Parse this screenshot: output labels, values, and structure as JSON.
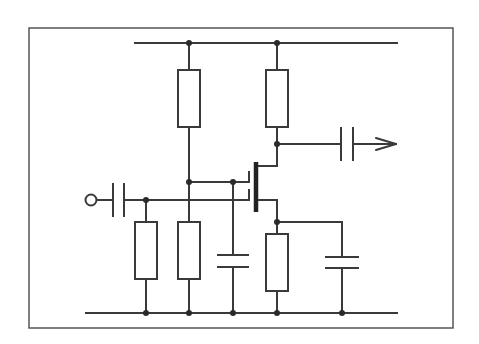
{
  "diagram": {
    "title": "Dual-gate MOSFET amplifier stage",
    "type": "circuit-schematic",
    "colors": {
      "line": "#3a3a3a",
      "frame": "#555555",
      "background": "#ffffff"
    },
    "components": [
      {
        "id": "R1",
        "kind": "resistor",
        "position": "top-left, supply to gate2 bias"
      },
      {
        "id": "R2",
        "kind": "resistor",
        "position": "top-right, drain load"
      },
      {
        "id": "R3",
        "kind": "resistor",
        "position": "gate1 to ground"
      },
      {
        "id": "R4",
        "kind": "resistor",
        "position": "gate2 bias to ground"
      },
      {
        "id": "R5",
        "kind": "resistor",
        "position": "source to ground"
      },
      {
        "id": "C1",
        "kind": "capacitor",
        "position": "input coupling"
      },
      {
        "id": "C2",
        "kind": "capacitor",
        "position": "output coupling"
      },
      {
        "id": "C3",
        "kind": "capacitor",
        "position": "gate2 decoupling"
      },
      {
        "id": "C4",
        "kind": "capacitor",
        "position": "source bypass"
      },
      {
        "id": "Q1",
        "kind": "dual-gate-mosfet",
        "position": "center"
      }
    ],
    "terminals": [
      {
        "id": "input",
        "symbol": "open-circle"
      },
      {
        "id": "output",
        "symbol": "arrow"
      }
    ]
  }
}
